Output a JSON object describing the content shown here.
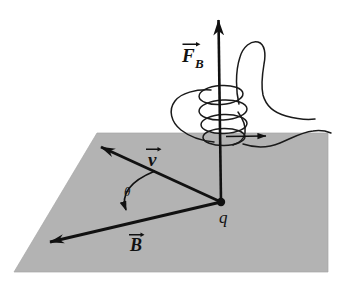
{
  "figure": {
    "type": "physics-vector-diagram",
    "canvas": {
      "width": 343,
      "height": 287,
      "background": "#ffffff"
    },
    "colors": {
      "plane_fill": "#b3b3b3",
      "plane_stroke": "#9a9a9a",
      "ink": "#111111",
      "hand_stroke": "#1a1a1a",
      "background": "#ffffff"
    },
    "plane": {
      "name": "horizontal-plane",
      "shape": "parallelogram",
      "points": "97,133 328,133 328,272 14,272",
      "fill": "#b3b3b3"
    },
    "charge": {
      "label": "q",
      "name": "point-charge",
      "x": 221,
      "y": 202,
      "radius": 4.2,
      "label_x": 224,
      "label_y": 222
    },
    "vectors": [
      {
        "id": "F_B",
        "symbol": "F",
        "subscript": "B",
        "name": "force-vector",
        "description": "Magnetic force, vertical, pointing up out of the plane",
        "from": {
          "x": 221,
          "y": 202
        },
        "to": {
          "x": 218,
          "y": 14
        },
        "label_x": 186,
        "label_y": 58,
        "overarrow": true
      },
      {
        "id": "v",
        "symbol": "v",
        "subscript": "",
        "name": "velocity-vector",
        "description": "Velocity of the charge, in-plane, up-left from q",
        "from": {
          "x": 221,
          "y": 202
        },
        "to": {
          "x": 97,
          "y": 145
        },
        "label_x": 148,
        "label_y": 163,
        "overarrow": true
      },
      {
        "id": "B",
        "symbol": "B",
        "subscript": "",
        "name": "magnetic-field-vector",
        "description": "Magnetic field, in-plane, down-left from q",
        "from": {
          "x": 221,
          "y": 202
        },
        "to": {
          "x": 45,
          "y": 243
        },
        "label_x": 131,
        "label_y": 248,
        "overarrow": true
      }
    ],
    "angle": {
      "symbol": "θ",
      "name": "angle-theta",
      "description": "Angle between v and B measured at the charge",
      "label_x": 128,
      "label_y": 194,
      "arc_path": "M 153 172 Q 118 186 126 212",
      "arrow_at": "B-side"
    },
    "hand": {
      "name": "right-hand",
      "description": "Right hand with curled fingers and thumb pointing up along F_B",
      "finger_loops": 4,
      "thumb_direction": "up",
      "finger_curl_arrow": {
        "name": "finger-curl-arrow",
        "from": {
          "x": 228,
          "y": 137
        },
        "to": {
          "x": 266,
          "y": 136
        },
        "description": "Small arrow showing direction fingers curl / point"
      }
    }
  }
}
